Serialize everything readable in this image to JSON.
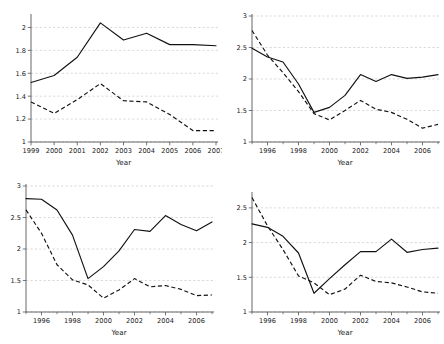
{
  "figure": {
    "background": "#ffffff",
    "line_color": "#111111",
    "grid_color": "#b9b9b9",
    "panel_count": 4,
    "layout": "2x2"
  },
  "chart_data": [
    {
      "type": "line",
      "panel": "top-left",
      "title": "",
      "xlabel": "Year",
      "ylabel": "",
      "x": [
        1999,
        2000,
        2001,
        2002,
        2003,
        2004,
        2005,
        2006,
        2007
      ],
      "xlim": [
        1999,
        2007
      ],
      "ylim": [
        1,
        2.1
      ],
      "xticks": [
        1999,
        2000,
        2001,
        2002,
        2003,
        2004,
        2005,
        2006,
        2007
      ],
      "xtick_labels": [
        "1999",
        "2000",
        "2001",
        "2002",
        "2003",
        "2004",
        "2005",
        "2006",
        "2007"
      ],
      "yticks": [
        1,
        1.2,
        1.4,
        1.6,
        1.8,
        2
      ],
      "ytick_labels": [
        "1",
        "1.2",
        "1.4",
        "1.6",
        "1.8",
        "2"
      ],
      "grid": true,
      "legend": "none",
      "series": [
        {
          "name": "solid",
          "style": "solid",
          "values": [
            1.52,
            1.58,
            1.74,
            2.04,
            1.89,
            1.95,
            1.85,
            1.85,
            1.84
          ]
        },
        {
          "name": "dashed",
          "style": "dashed",
          "values": [
            1.35,
            1.25,
            1.37,
            1.51,
            1.36,
            1.35,
            1.24,
            1.1,
            1.1
          ]
        }
      ]
    },
    {
      "type": "line",
      "panel": "top-right",
      "title": "",
      "xlabel": "Year",
      "ylabel": "",
      "x": [
        1995,
        1996,
        1997,
        1998,
        1999,
        2000,
        2001,
        2002,
        2003,
        2004,
        2005,
        2006,
        2007
      ],
      "xlim": [
        1995,
        2007
      ],
      "ylim": [
        1,
        3
      ],
      "xticks": [
        1996,
        1998,
        2000,
        2002,
        2004,
        2006
      ],
      "xtick_labels": [
        "1996",
        "1998",
        "2000",
        "2002",
        "2004",
        "2006"
      ],
      "yticks": [
        1,
        1.5,
        2,
        2.5,
        3
      ],
      "ytick_labels": [
        "1",
        "1.5",
        "2",
        "2.5",
        "3"
      ],
      "grid": true,
      "legend": "none",
      "series": [
        {
          "name": "solid",
          "style": "solid",
          "values": [
            2.49,
            2.35,
            2.27,
            1.92,
            1.47,
            1.55,
            1.74,
            2.07,
            1.96,
            2.07,
            2.01,
            2.03,
            2.07
          ]
        },
        {
          "name": "dashed",
          "style": "dashed",
          "values": [
            2.77,
            2.38,
            2.1,
            1.8,
            1.45,
            1.35,
            1.5,
            1.66,
            1.52,
            1.47,
            1.36,
            1.22,
            1.28
          ]
        }
      ]
    },
    {
      "type": "line",
      "panel": "bottom-left",
      "title": "",
      "xlabel": "Year",
      "ylabel": "",
      "x": [
        1995,
        1996,
        1997,
        1998,
        1999,
        2000,
        2001,
        2002,
        2003,
        2004,
        2005,
        2006,
        2007
      ],
      "xlim": [
        1995,
        2007
      ],
      "ylim": [
        1,
        3
      ],
      "xticks": [
        1996,
        1998,
        2000,
        2002,
        2004,
        2006
      ],
      "xtick_labels": [
        "1996",
        "1998",
        "2000",
        "2002",
        "2004",
        "2006"
      ],
      "yticks": [
        1,
        1.5,
        2,
        2.5,
        3
      ],
      "ytick_labels": [
        "1",
        "1.5",
        "2",
        "2.5",
        "3"
      ],
      "grid": true,
      "legend": "none",
      "series": [
        {
          "name": "solid",
          "style": "solid",
          "values": [
            2.8,
            2.79,
            2.62,
            2.22,
            1.53,
            1.72,
            1.97,
            2.31,
            2.28,
            2.53,
            2.39,
            2.29,
            2.43
          ]
        },
        {
          "name": "dashed",
          "style": "dashed",
          "values": [
            2.62,
            2.25,
            1.75,
            1.51,
            1.43,
            1.22,
            1.35,
            1.53,
            1.4,
            1.42,
            1.36,
            1.26,
            1.27
          ]
        }
      ]
    },
    {
      "type": "line",
      "panel": "bottom-right",
      "title": "",
      "xlabel": "Year",
      "ylabel": "",
      "x": [
        1995,
        1996,
        1997,
        1998,
        1999,
        2000,
        2001,
        2002,
        2003,
        2004,
        2005,
        2006,
        2007
      ],
      "xlim": [
        1995,
        2007
      ],
      "ylim": [
        1,
        2.7
      ],
      "xticks": [
        1996,
        1998,
        2000,
        2002,
        2004,
        2006
      ],
      "xtick_labels": [
        "1996",
        "1998",
        "2000",
        "2002",
        "2004",
        "2006"
      ],
      "yticks": [
        1,
        1.5,
        2,
        2.5
      ],
      "ytick_labels": [
        "1",
        "1.5",
        "2",
        "2.5"
      ],
      "grid": true,
      "legend": "none",
      "series": [
        {
          "name": "solid",
          "style": "solid",
          "values": [
            2.27,
            2.22,
            2.09,
            1.85,
            1.27,
            1.48,
            1.68,
            1.87,
            1.87,
            2.05,
            1.86,
            1.9,
            1.92
          ]
        },
        {
          "name": "dashed",
          "style": "dashed",
          "values": [
            2.65,
            2.24,
            1.9,
            1.52,
            1.42,
            1.25,
            1.33,
            1.53,
            1.44,
            1.42,
            1.36,
            1.29,
            1.27
          ]
        }
      ]
    }
  ]
}
